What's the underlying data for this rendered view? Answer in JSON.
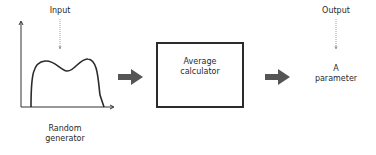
{
  "diagram": {
    "input_label": "Input",
    "generator_label_line1": "Random",
    "generator_label_line2": "generator",
    "calculator_label_line1": "Average",
    "calculator_label_line2": "calculator",
    "output_label": "Output",
    "result_label_line1": "A",
    "result_label_line2": "parameter"
  },
  "colors": {
    "stroke": "#2b2b2b",
    "arrow_fill": "#555555",
    "pointer": "#888888"
  }
}
